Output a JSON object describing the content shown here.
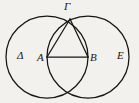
{
  "figure": {
    "kind": "geometry-diagram",
    "background_color": "#f2f1ee",
    "ink_color": "#171512",
    "width": 139,
    "height": 103,
    "labels": [
      {
        "id": "gamma",
        "text": "Γ",
        "role": "apex-vertex",
        "x": 70,
        "y": 19
      },
      {
        "id": "delta",
        "text": "Δ",
        "role": "left-circle-region",
        "x": 21,
        "y": 57
      },
      {
        "id": "a",
        "text": "A",
        "role": "left-circle-center",
        "x": 47,
        "y": 57
      },
      {
        "id": "b",
        "text": "B",
        "role": "right-circle-center",
        "x": 88,
        "y": 57
      },
      {
        "id": "e",
        "text": "E",
        "role": "right-circle-region",
        "x": 120,
        "y": 57
      }
    ],
    "circles": [
      {
        "id": "left-circle",
        "center_label": "A",
        "cx": 47,
        "cy": 57,
        "r": 41
      },
      {
        "id": "right-circle",
        "center_label": "B",
        "cx": 88,
        "cy": 57,
        "r": 41
      }
    ],
    "segments": [
      {
        "id": "segment-ab",
        "from": "A",
        "to": "B",
        "x1": 47,
        "y1": 57,
        "x2": 88,
        "y2": 57
      },
      {
        "id": "segment-a-gamma",
        "from": "A",
        "to": "Γ",
        "x1": 47,
        "y1": 57,
        "x2": 70,
        "y2": 19
      },
      {
        "id": "segment-b-gamma",
        "from": "B",
        "to": "Γ",
        "x1": 88,
        "y1": 57,
        "x2": 70,
        "y2": 19
      }
    ],
    "intersection_points": [
      {
        "id": "upper-intersection",
        "label": "Γ",
        "x": 70,
        "y": 19
      },
      {
        "id": "lower-intersection",
        "label": "",
        "x": 70,
        "y": 95
      }
    ]
  }
}
